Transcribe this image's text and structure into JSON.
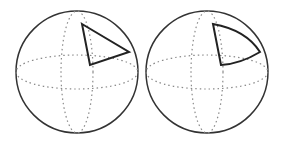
{
  "figure": {
    "colors": {
      "outline": "#333333",
      "grid": "#8a8a8a",
      "shape": "#222222",
      "background": "#ffffff"
    },
    "spheres": [
      {
        "id": "left",
        "cx": 77,
        "cy": 72,
        "r": 61,
        "shape": "planar-triangle"
      },
      {
        "id": "right",
        "cx": 207,
        "cy": 72,
        "r": 61,
        "shape": "spherical-triangle"
      }
    ]
  }
}
